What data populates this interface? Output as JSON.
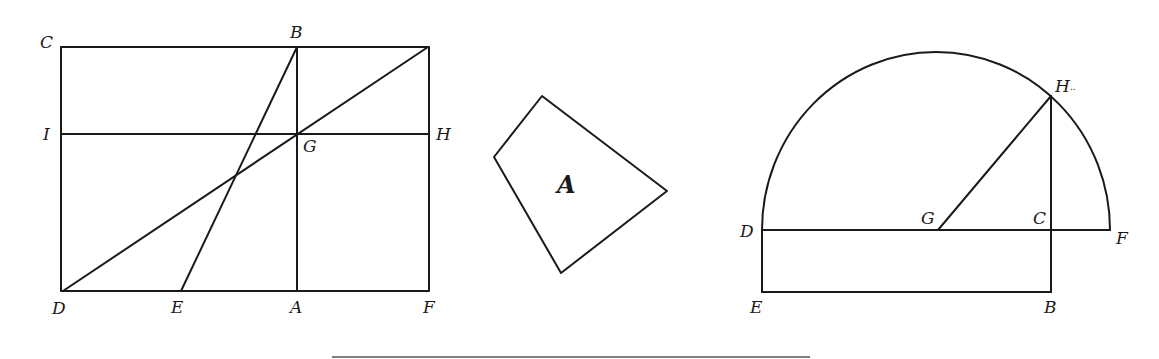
{
  "figures": {
    "rectangle": {
      "labels": {
        "C": "C",
        "B": "B",
        "I": "I",
        "H": "H",
        "G": "G",
        "D": "D",
        "E": "E",
        "A": "A",
        "F": "F"
      }
    },
    "quadrilateral": {
      "labels": {
        "A": "A"
      }
    },
    "semicircle": {
      "labels": {
        "H": "H",
        "H_dots": "..",
        "D": "D",
        "G": "G",
        "C": "C",
        "F": "F",
        "E": "E",
        "B": "B"
      }
    }
  }
}
